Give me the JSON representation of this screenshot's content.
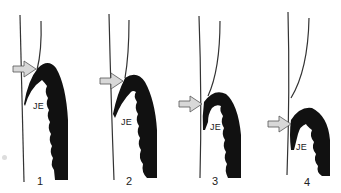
{
  "figure": {
    "colors": {
      "epithelium": "#111111",
      "tooth_line": "#333333",
      "arrow_fill": "#d8d8d8",
      "arrow_stroke": "#555555",
      "background": "#ffffff"
    },
    "panels": [
      {
        "number": "1",
        "je_label": "JE",
        "arrow": "arrow-right-icon"
      },
      {
        "number": "2",
        "je_label": "JE",
        "arrow": "arrow-right-icon"
      },
      {
        "number": "3",
        "je_label": "JE",
        "arrow": "arrow-right-icon"
      },
      {
        "number": "4",
        "je_label": "JE",
        "arrow": "arrow-right-icon"
      }
    ]
  }
}
